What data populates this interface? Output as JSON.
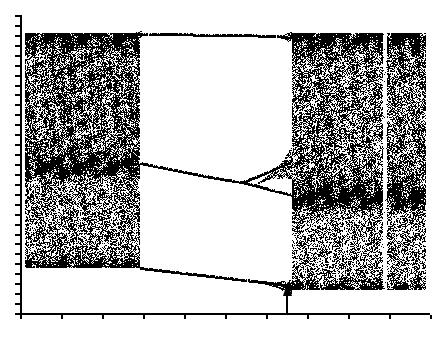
{
  "figure": {
    "title": "",
    "background_color": "#ffffff",
    "ink_color": "#000000",
    "width": 437,
    "height": 337
  },
  "axes": {
    "y_axis": {
      "label": "",
      "x_px": 20,
      "top_px": 15,
      "bottom_px": 313,
      "tick_count": 30,
      "tick_length_px": 5,
      "tick_side": "left"
    },
    "x_axis": {
      "label": "",
      "y_px": 313,
      "left_px": 20,
      "right_px": 430,
      "tick_count": 11,
      "tick_spacing_px": 41,
      "tick_length_px": 4,
      "tick_side": "below"
    },
    "tick_labels_x": [],
    "tick_labels_y": []
  },
  "annotations": [
    {
      "name": "parameter-marker-arrow",
      "kind": "arrow",
      "direction": "up",
      "x_px": 287,
      "tip_y_px": 282,
      "tail_y_px": 314,
      "head_width_px": 9,
      "head_height_px": 14,
      "shaft_width_px": 2,
      "color": "#000000",
      "text": ""
    }
  ],
  "chart_data": {
    "type": "scatter",
    "title": "",
    "subtitle": "",
    "xlabel": "",
    "ylabel": "",
    "xlim": [
      0,
      1
    ],
    "ylim": [
      0,
      1
    ],
    "grid": false,
    "legend": null,
    "plot_box_px": {
      "left": 20,
      "right": 430,
      "top": 15,
      "bottom": 313
    },
    "data_box_px": {
      "left": 25,
      "right": 426,
      "top": 33,
      "bottom": 290
    },
    "regions": [
      {
        "name": "left-chaotic-band-upper",
        "type": "chaotic-fill",
        "x_px": [
          25,
          140
        ],
        "y_px": [
          33,
          168
        ],
        "density": 0.62,
        "edge_density": 0.92,
        "note": "dense speckled chaotic band, darker along upper and lower edges"
      },
      {
        "name": "left-chaotic-band-lower",
        "type": "chaotic-fill",
        "x_px": [
          25,
          142
        ],
        "y_px": [
          168,
          268
        ],
        "density": 0.5,
        "edge_density": 0.9,
        "note": "slightly sparser lower chaotic band of the same attractor"
      },
      {
        "name": "periodic-window",
        "type": "window",
        "x_px": [
          140,
          292
        ],
        "y_px": [
          33,
          290
        ],
        "density": 0.0,
        "note": "wide periodic window, mostly white with three thin orbit branches"
      },
      {
        "name": "right-chaotic-band-upper",
        "type": "chaotic-fill",
        "x_px": [
          292,
          426
        ],
        "y_px": [
          33,
          200
        ],
        "density": 0.55,
        "edge_density": 0.95,
        "note": "reconstituted chaotic band after the window"
      },
      {
        "name": "right-chaotic-band-lower",
        "type": "chaotic-fill",
        "x_px": [
          292,
          426
        ],
        "y_px": [
          200,
          290
        ],
        "density": 0.45,
        "edge_density": 0.9,
        "note": "lower chaotic band, sparser, bounded below by the descending branch"
      },
      {
        "name": "interior-periodic-stripe",
        "type": "white-stripe",
        "x_px": [
          383,
          387
        ],
        "y_px": [
          33,
          290
        ],
        "density": 0.05,
        "note": "narrow vertical periodic window cutting through the right chaotic band"
      }
    ],
    "branches": [
      {
        "name": "upper-branch",
        "points_px": [
          [
            140,
            34
          ],
          [
            175,
            34
          ],
          [
            210,
            35
          ],
          [
            245,
            35
          ],
          [
            270,
            36
          ],
          [
            292,
            37
          ]
        ],
        "thickness_px": 2,
        "note": "flat upper orbit branch across the periodic window"
      },
      {
        "name": "middle-branch",
        "points_px": [
          [
            140,
            163
          ],
          [
            175,
            170
          ],
          [
            205,
            176
          ],
          [
            228,
            180
          ],
          [
            242,
            182
          ]
        ],
        "thickness_px": 2,
        "note": "descending middle orbit branch up to its period-doubling point"
      },
      {
        "name": "middle-branch-split-upper",
        "points_px": [
          [
            242,
            182
          ],
          [
            258,
            176
          ],
          [
            272,
            170
          ],
          [
            285,
            164
          ],
          [
            292,
            160
          ]
        ],
        "thickness_px": 2,
        "note": "upper arm after period doubling of the middle branch"
      },
      {
        "name": "middle-branch-split-lower",
        "points_px": [
          [
            242,
            182
          ],
          [
            258,
            186
          ],
          [
            272,
            190
          ],
          [
            285,
            193
          ],
          [
            292,
            195
          ]
        ],
        "thickness_px": 2,
        "note": "lower arm after period doubling of the middle branch"
      },
      {
        "name": "lower-branch",
        "points_px": [
          [
            140,
            268
          ],
          [
            175,
            272
          ],
          [
            210,
            276
          ],
          [
            245,
            280
          ],
          [
            270,
            283
          ],
          [
            292,
            286
          ]
        ],
        "thickness_px": 2,
        "note": "descending lower orbit branch, broadening into chaos at the right"
      }
    ],
    "bifurcation_points_px": [
      {
        "name": "middle-branch-period-doubling",
        "x_px": 242,
        "y_px": 182
      },
      {
        "name": "window-onset",
        "x_px": 140
      },
      {
        "name": "window-end",
        "x_px": 292
      }
    ],
    "marker_x_px": 287,
    "seed": 20240917
  }
}
